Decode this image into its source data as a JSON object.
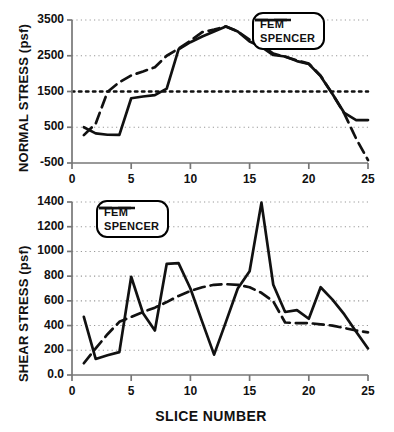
{
  "figure": {
    "xlabel": "SLICE NUMBER"
  },
  "legend": {
    "fem": "FEM",
    "spencer": "SPENCER"
  },
  "colors": {
    "line": "#111111",
    "grid": "#999999",
    "axis": "#777777",
    "background": "#ffffff"
  },
  "chart_data": [
    {
      "type": "line",
      "id": "normal-stress",
      "title": "",
      "xlabel": "SLICE NUMBER",
      "ylabel": "NORMAL STRESS (psf)",
      "xlim": [
        0,
        25
      ],
      "ylim": [
        -500,
        3500
      ],
      "xticks": [
        0,
        5,
        10,
        15,
        20,
        25
      ],
      "yticks": [
        -500,
        500,
        1500,
        2500,
        3500
      ],
      "yticklabels": [
        "-500",
        "500",
        "1500",
        "2500",
        "3500"
      ],
      "grid": true,
      "legend_position": "upper-right",
      "emphasized_gridline": 1500,
      "x": [
        1,
        2,
        3,
        4,
        5,
        6,
        7,
        8,
        9,
        10,
        11,
        12,
        13,
        14,
        15,
        16,
        17,
        18,
        19,
        20,
        21,
        22,
        23,
        24,
        25
      ],
      "series": [
        {
          "name": "FEM",
          "style": "solid",
          "values": [
            500,
            330,
            290,
            285,
            1310,
            1360,
            1400,
            1580,
            2680,
            2880,
            3040,
            3180,
            3320,
            3180,
            2900,
            2750,
            2520,
            2480,
            2350,
            2270,
            1930,
            1430,
            900,
            700,
            700
          ]
        },
        {
          "name": "SPENCER",
          "style": "dashed",
          "values": [
            280,
            600,
            1490,
            1760,
            1950,
            2060,
            2180,
            2500,
            2700,
            2920,
            3160,
            3230,
            3320,
            3180,
            2950,
            2790,
            2560,
            2470,
            2370,
            2280,
            1940,
            1430,
            880,
            180,
            -420
          ]
        }
      ]
    },
    {
      "type": "line",
      "id": "shear-stress",
      "title": "",
      "xlabel": "SLICE NUMBER",
      "ylabel": "SHEAR STRESS (psf)",
      "xlim": [
        0,
        25
      ],
      "ylim": [
        0,
        1400
      ],
      "xticks": [
        0,
        5,
        10,
        15,
        20,
        25
      ],
      "yticks": [
        0,
        200,
        400,
        600,
        800,
        1000,
        1200,
        1400
      ],
      "yticklabels": [
        "0.0",
        "200",
        "400",
        "600",
        "800",
        "1000",
        "1200",
        "1400"
      ],
      "grid": true,
      "legend_position": "upper-left",
      "x": [
        1,
        2,
        3,
        4,
        5,
        6,
        7,
        8,
        9,
        10,
        11,
        12,
        13,
        14,
        15,
        16,
        17,
        18,
        19,
        20,
        21,
        22,
        23,
        24,
        25
      ],
      "series": [
        {
          "name": "FEM",
          "style": "solid",
          "values": [
            470,
            130,
            160,
            185,
            795,
            500,
            360,
            900,
            905,
            700,
            430,
            165,
            430,
            700,
            840,
            1395,
            730,
            510,
            525,
            455,
            710,
            610,
            490,
            350,
            215
          ]
        },
        {
          "name": "SPENCER",
          "style": "dashed",
          "values": [
            95,
            215,
            330,
            430,
            470,
            510,
            545,
            590,
            640,
            680,
            710,
            730,
            735,
            730,
            710,
            665,
            595,
            425,
            420,
            420,
            410,
            400,
            380,
            360,
            345
          ]
        }
      ]
    }
  ]
}
